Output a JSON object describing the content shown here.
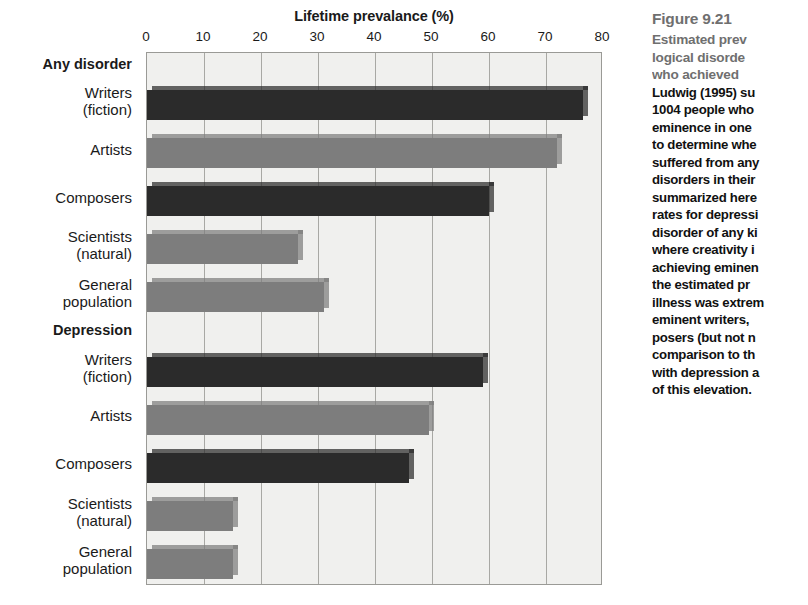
{
  "chart_data": {
    "type": "bar",
    "orientation": "horizontal",
    "title": "Lifetime prevalance (%)",
    "xlabel": "Lifetime prevalance (%)",
    "ylabel": "",
    "xlim": [
      0,
      80
    ],
    "xticks": [
      0,
      10,
      20,
      30,
      40,
      50,
      60,
      70,
      80
    ],
    "grid": true,
    "legend": "none",
    "groups": [
      {
        "name": "Any disorder",
        "categories": [
          "Writers (fiction)",
          "Artists",
          "Composers",
          "Scientists (natural)",
          "General population"
        ],
        "values": [
          76.5,
          72,
          60,
          26.5,
          31
        ]
      },
      {
        "name": "Depression",
        "categories": [
          "Writers (fiction)",
          "Artists",
          "Composers",
          "Scientists (natural)",
          "General population"
        ],
        "values": [
          59,
          49.5,
          46,
          15,
          15
        ]
      }
    ],
    "bar_colors": {
      "dark": "#2b2b2b",
      "mid": "#7d7d7d",
      "light": "#8e8e8e"
    },
    "plot_background": "#f0f0ee"
  },
  "chart": {
    "title": "Lifetime prevalance (%)",
    "xticks": [
      "0",
      "10",
      "20",
      "30",
      "40",
      "50",
      "60",
      "70",
      "80"
    ],
    "rows": [
      {
        "kind": "group",
        "line1": "Any disorder",
        "line2": ""
      },
      {
        "kind": "bar",
        "line1": "Writers",
        "line2": "(fiction)",
        "value": 76.5,
        "shade": "dark"
      },
      {
        "kind": "bar",
        "line1": "Artists",
        "line2": "",
        "value": 72,
        "shade": "mid"
      },
      {
        "kind": "bar",
        "line1": "Composers",
        "line2": "",
        "value": 60,
        "shade": "dark"
      },
      {
        "kind": "bar",
        "line1": "Scientists",
        "line2": "(natural)",
        "value": 26.5,
        "shade": "mid"
      },
      {
        "kind": "bar",
        "line1": "General",
        "line2": "population",
        "value": 31,
        "shade": "mid"
      },
      {
        "kind": "group",
        "line1": "Depression",
        "line2": ""
      },
      {
        "kind": "bar",
        "line1": "Writers",
        "line2": "(fiction)",
        "value": 59,
        "shade": "dark"
      },
      {
        "kind": "bar",
        "line1": "Artists",
        "line2": "",
        "value": 49.5,
        "shade": "mid"
      },
      {
        "kind": "bar",
        "line1": "Composers",
        "line2": "",
        "value": 46,
        "shade": "dark"
      },
      {
        "kind": "bar",
        "line1": "Scientists",
        "line2": "(natural)",
        "value": 15,
        "shade": "mid"
      },
      {
        "kind": "bar",
        "line1": "General",
        "line2": "population",
        "value": 15,
        "shade": "mid"
      }
    ]
  },
  "caption": {
    "figure_number": "Figure 9.21",
    "lead_lines": [
      "Estimated prev",
      "logical disorde",
      "who achieved "
    ],
    "body_lines": [
      "Ludwig (1995) su",
      "1004 people who",
      "eminence in one ",
      "to determine whe",
      "suffered from any",
      "disorders in their",
      "summarized here",
      "rates for depressi",
      "disorder of any ki",
      "where creativity i",
      "achieving eminen",
      "the estimated pr",
      "illness was extrem",
      "eminent writers, ",
      "posers (but not n",
      "comparison to th",
      "with depression a",
      "of this elevation."
    ]
  }
}
